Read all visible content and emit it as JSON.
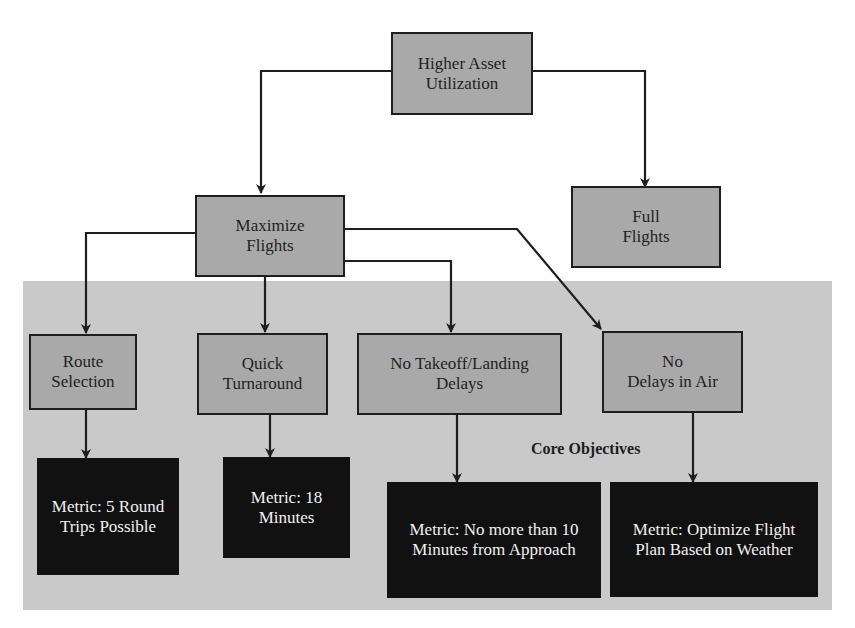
{
  "diagram": {
    "region_label": "Core Objectives",
    "nodes": {
      "root": "Higher Asset\nUtilization",
      "maximize_flights": "Maximize\nFlights",
      "full_flights": "Full\nFlights",
      "route_selection": "Route\nSelection",
      "quick_turnaround": "Quick\nTurnaround",
      "no_takeoff_landing_delays": "No Takeoff/Landing\nDelays",
      "no_delays_in_air": "No\nDelays in Air"
    },
    "metrics": {
      "route_selection": "Metric: 5 Round\nTrips Possible",
      "quick_turnaround": "Metric: 18\nMinutes",
      "no_takeoff_landing_delays": "Metric: No more than 10\nMinutes from Approach",
      "no_delays_in_air": "Metric: Optimize Flight\nPlan Based on Weather"
    },
    "edges": [
      [
        "Higher Asset Utilization",
        "Maximize Flights"
      ],
      [
        "Higher Asset Utilization",
        "Full Flights"
      ],
      [
        "Maximize Flights",
        "Route Selection"
      ],
      [
        "Maximize Flights",
        "Quick Turnaround"
      ],
      [
        "Maximize Flights",
        "No Takeoff/Landing Delays"
      ],
      [
        "Maximize Flights",
        "No Delays in Air"
      ],
      [
        "Route Selection",
        "Metric: 5 Round Trips Possible"
      ],
      [
        "Quick Turnaround",
        "Metric: 18 Minutes"
      ],
      [
        "No Takeoff/Landing Delays",
        "Metric: No more than 10 Minutes from Approach"
      ],
      [
        "No Delays in Air",
        "Metric: Optimize Flight Plan Based on Weather"
      ]
    ],
    "colors": {
      "node_fill": "#a9a9a9",
      "region_fill": "#c9c9c9",
      "metric_fill": "#111111",
      "metric_text": "#f2f2f2",
      "stroke": "#1e1e1e"
    }
  }
}
